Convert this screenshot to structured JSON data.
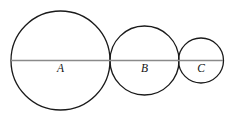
{
  "figure": {
    "background_color": "#ffffff",
    "width": 245,
    "height": 118
  },
  "style": {
    "circle_stroke_color": "#1a1a1a",
    "circle_stroke_width": 1.3,
    "circle_fill": "none",
    "baseline_color": "#8a8a8a",
    "baseline_width": 1.6,
    "label_color": "#111111",
    "label_font_size": 11.5,
    "label_font_style": "italic"
  },
  "baseline": {
    "name": "horizontal-diameter-line",
    "y": 60.5,
    "x_start": 11,
    "x_end": 223
  },
  "chart_data": {
    "type": "diagram",
    "subtitle": "",
    "xlabel": "",
    "ylabel": "",
    "grid": false,
    "legend": null,
    "units": "pixels",
    "circles": [
      {
        "label": "A",
        "cx": 60.5,
        "cy": 60.5,
        "r": 49.5,
        "diameter": 99,
        "label_x": 60.5,
        "label_y": 72
      },
      {
        "label": "B",
        "cx": 144.5,
        "cy": 60.5,
        "r": 34.5,
        "diameter": 69,
        "label_x": 144.5,
        "label_y": 72
      },
      {
        "label": "C",
        "cx": 201,
        "cy": 60.5,
        "r": 22.5,
        "diameter": 45,
        "label_x": 201,
        "label_y": 72
      }
    ],
    "tangency_points_x": [
      110,
      179
    ]
  }
}
